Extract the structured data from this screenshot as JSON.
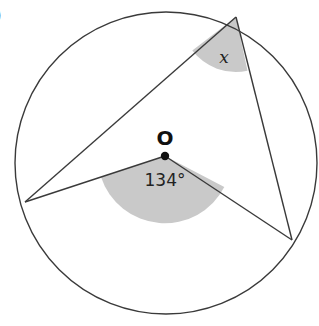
{
  "figure": {
    "part_label": ")",
    "center_label": "O",
    "central_angle_label": "134°",
    "inscribed_angle_label": "x"
  },
  "colors": {
    "stroke": "#3a3a3a",
    "shade": "#c9c9c9",
    "background": "#ffffff"
  }
}
